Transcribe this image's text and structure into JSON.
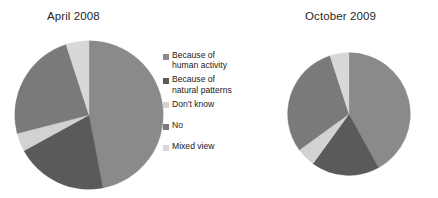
{
  "chart_data": [
    {
      "type": "pie",
      "title": "April 2008",
      "categories": [
        "Because of human activity",
        "Because of natural patterns",
        "Don't know",
        "No",
        "Mixed view"
      ],
      "values": [
        47,
        20,
        4,
        24,
        5
      ],
      "colors": [
        "#8a8a8a",
        "#5a5a5a",
        "#d2d2d2",
        "#7a7a7a",
        "#d8d8d8"
      ],
      "start_angle": 0,
      "direction": "clockwise",
      "legend": "shared",
      "legend_position": "center",
      "grid": false
    },
    {
      "type": "pie",
      "title": "October 2009",
      "categories": [
        "Because of human activity",
        "Because of natural patterns",
        "Don't know",
        "No",
        "Mixed view"
      ],
      "values": [
        42,
        18,
        5,
        30,
        5
      ],
      "colors": [
        "#8a8a8a",
        "#5a5a5a",
        "#d2d2d2",
        "#7a7a7a",
        "#d8d8d8"
      ],
      "start_angle": 0,
      "direction": "clockwise",
      "legend": "shared",
      "legend_position": "center",
      "grid": false
    }
  ],
  "titles": {
    "april": "April 2008",
    "october": "October 2009"
  },
  "legend": {
    "items": [
      {
        "label": "Because of\nhuman activity",
        "color": "#8a8a8a"
      },
      {
        "label": "Because of\nnatural patterns",
        "color": "#5a5a5a"
      },
      {
        "label": "Don't know",
        "color": "#d2d2d2"
      },
      {
        "label": "No",
        "color": "#7a7a7a"
      },
      {
        "label": "Mixed view",
        "color": "#d8d8d8"
      }
    ]
  }
}
